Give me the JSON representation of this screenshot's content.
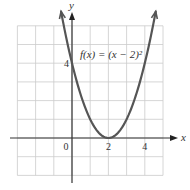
{
  "chart_data": {
    "type": "line",
    "title": "",
    "function_label": "f(x) = (x − 2)²",
    "xlabel": "x",
    "ylabel": "y",
    "xlim": [
      -3,
      5
    ],
    "ylim": [
      -2,
      6
    ],
    "grid": true,
    "x_tick_labels": [
      {
        "value": 0,
        "label": "0"
      },
      {
        "value": 2,
        "label": "2"
      },
      {
        "value": 4,
        "label": "4"
      }
    ],
    "y_tick_labels": [
      {
        "value": 4,
        "label": "4"
      }
    ],
    "series": [
      {
        "name": "f(x) = (x − 2)²",
        "x": [
          -0.6,
          -0.5,
          0,
          0.5,
          1,
          1.5,
          2,
          2.5,
          3,
          3.5,
          4,
          4.5,
          4.6
        ],
        "y": [
          6.76,
          6.25,
          4,
          2.25,
          1,
          0.25,
          0,
          0.25,
          1,
          2.25,
          4,
          6.25,
          6.76
        ]
      }
    ],
    "key_points": [
      {
        "x": 0,
        "y": 4,
        "note": "y-intercept"
      },
      {
        "x": 2,
        "y": 0,
        "note": "vertex"
      }
    ],
    "colors": {
      "curve": "#555555",
      "axes": "#333333",
      "grid": "#cccccc"
    }
  }
}
